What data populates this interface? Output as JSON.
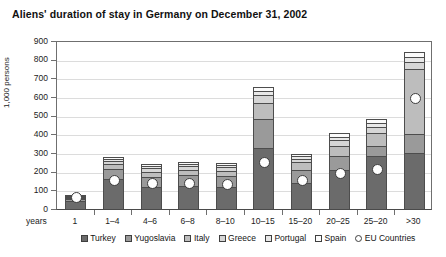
{
  "chart_data": {
    "type": "bar",
    "title": "Aliens' duration of stay in Germany on December 31, 2002",
    "xlabel": "years",
    "ylabel": "1,000 persons",
    "ylim": [
      0,
      900
    ],
    "ytick_step": 100,
    "grid": true,
    "stacked": true,
    "legend_position": "bottom",
    "yticks": [
      "900",
      "800",
      "700",
      "600",
      "500",
      "400",
      "300",
      "200",
      "100",
      "0"
    ],
    "categories": [
      "1",
      "1–4",
      "4–6",
      "6–8",
      "8–10",
      "10–15",
      "15–20",
      "20–25",
      "25–20",
      ">30"
    ],
    "series": [
      {
        "name": "Turkey",
        "color": "#6b6b6b",
        "values": [
          45,
          160,
          120,
          125,
          120,
          325,
          140,
          210,
          285,
          300
        ]
      },
      {
        "name": "Yugoslavia",
        "color": "#9a9a9a",
        "values": [
          10,
          55,
          50,
          55,
          55,
          155,
          70,
          75,
          55,
          100
        ]
      },
      {
        "name": "Italy",
        "color": "#bdbdbd",
        "values": [
          5,
          25,
          30,
          30,
          30,
          90,
          40,
          55,
          65,
          350
        ]
      },
      {
        "name": "Greece",
        "color": "#d6d6d6",
        "values": [
          4,
          15,
          18,
          18,
          18,
          40,
          20,
          30,
          35,
          40
        ]
      },
      {
        "name": "Portugal",
        "color": "#e8e8e8",
        "values": [
          3,
          12,
          12,
          12,
          12,
          25,
          12,
          18,
          20,
          25
        ]
      },
      {
        "name": "Spain",
        "color": "#fbfbfb",
        "values": [
          3,
          13,
          10,
          10,
          10,
          20,
          13,
          22,
          25,
          25
        ]
      }
    ],
    "marker_series": {
      "name": "EU Countries",
      "marker": "diamond",
      "values": [
        55,
        150,
        130,
        130,
        125,
        245,
        145,
        185,
        205,
        585
      ]
    }
  },
  "legend": {
    "items": [
      {
        "label": "Turkey",
        "swatch": "legend-swatch-turkey"
      },
      {
        "label": "Yugoslavia",
        "swatch": "legend-swatch-yugoslavia"
      },
      {
        "label": "Italy",
        "swatch": "legend-swatch-italy"
      },
      {
        "label": "Greece",
        "swatch": "legend-swatch-greece"
      },
      {
        "label": "Portugal",
        "swatch": "legend-swatch-portugal"
      },
      {
        "label": "Spain",
        "swatch": "legend-swatch-spain"
      },
      {
        "label": "EU Countries",
        "swatch": "legend-marker-eu"
      }
    ]
  }
}
